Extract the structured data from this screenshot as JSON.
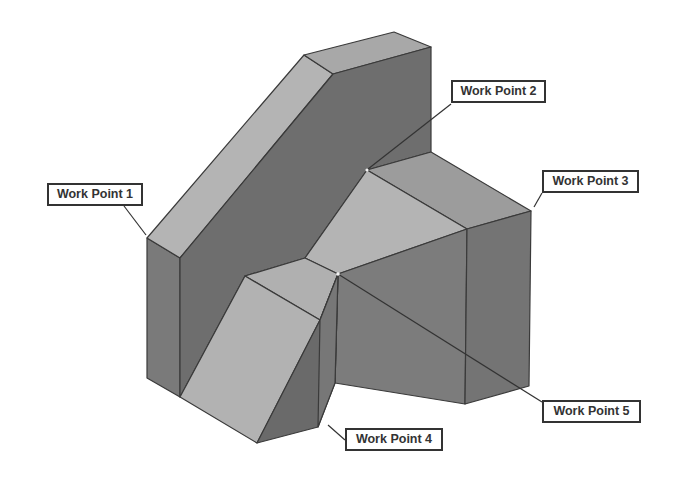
{
  "diagram": {
    "type": "isometric-solid-with-work-points",
    "colors": {
      "background": "#ffffff",
      "light_face": "#b4b4b4",
      "mid_face": "#9c9c9c",
      "dark_face": "#6e6e6e",
      "side_face": "#7a7a7a",
      "edge": "#2e2e2e",
      "label_border": "#333333"
    },
    "labels": [
      {
        "id": "wp1",
        "text": "Work Point 1"
      },
      {
        "id": "wp2",
        "text": "Work Point 2"
      },
      {
        "id": "wp3",
        "text": "Work Point 3"
      },
      {
        "id": "wp4",
        "text": "Work Point 4"
      },
      {
        "id": "wp5",
        "text": "Work Point 5"
      }
    ]
  }
}
